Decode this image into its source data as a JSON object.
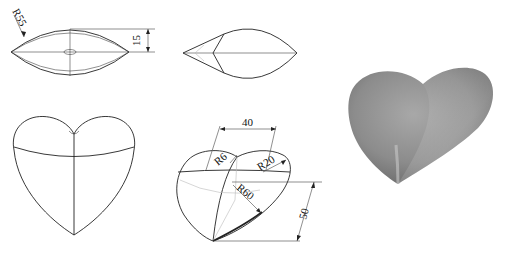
{
  "views": {
    "front_profile": {
      "label": "front-profile-view",
      "dimensions": [
        {
          "name": "radius-R55",
          "text": "R55"
        },
        {
          "name": "height-15",
          "text": "15"
        }
      ]
    },
    "side_profile": {
      "label": "side-profile-view"
    },
    "top_view": {
      "label": "top-view-heart"
    },
    "isometric": {
      "label": "isometric-view",
      "dimensions": [
        {
          "name": "width-40",
          "text": "40"
        },
        {
          "name": "radius-R6",
          "text": "R6"
        },
        {
          "name": "radius-R20",
          "text": "R20"
        },
        {
          "name": "radius-R60",
          "text": "R60"
        },
        {
          "name": "height-50",
          "text": "50"
        }
      ]
    },
    "render": {
      "label": "3d-shaded-render",
      "colors": {
        "light": "#bdbdbd",
        "mid": "#8f8f8f",
        "dark": "#5a5a5a"
      }
    }
  }
}
